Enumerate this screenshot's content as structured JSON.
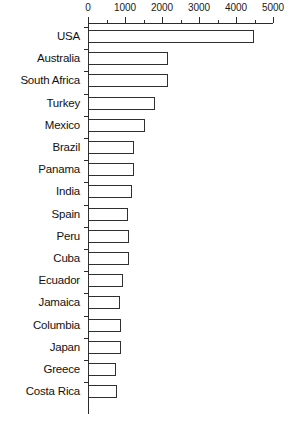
{
  "chart_data": {
    "type": "bar",
    "orientation": "horizontal",
    "title": "",
    "xlabel": "",
    "ylabel": "",
    "xlim": [
      0,
      5000
    ],
    "grid": false,
    "legend": false,
    "x_tick_labels": [
      "0",
      "1000",
      "2000",
      "3000",
      "4000",
      "5000"
    ],
    "x_tick_values": [
      0,
      1000,
      2000,
      3000,
      4000,
      5000
    ],
    "x_minor_tick_values": [
      500,
      1500,
      2500,
      3500,
      4500
    ],
    "categories": [
      "USA",
      "Australia",
      "South Africa",
      "Turkey",
      "Mexico",
      "Brazil",
      "Panama",
      "India",
      "Spain",
      "Peru",
      "Cuba",
      "Ecuador",
      "Jamaica",
      "Columbia",
      "Japan",
      "Greece",
      "Costa Rica"
    ],
    "values": [
      4480,
      2150,
      2150,
      1820,
      1550,
      1230,
      1250,
      1200,
      1090,
      1110,
      1100,
      950,
      870,
      880,
      900,
      760,
      790
    ],
    "bar_fill_color": "#ffffff",
    "bar_edge_color": "#2f2f2f",
    "axis_color": "#2b2b2b",
    "text_color": "#111111"
  }
}
